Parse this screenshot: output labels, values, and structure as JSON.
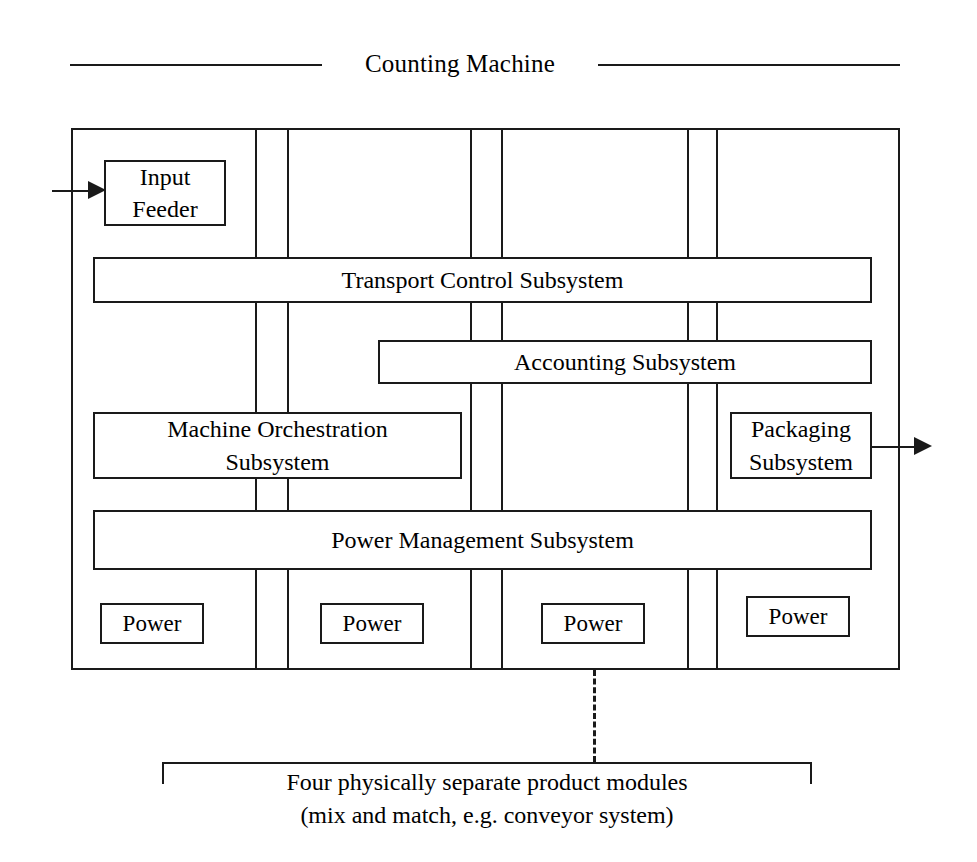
{
  "diagram": {
    "title": "Counting Machine",
    "boxes": {
      "input_feeder": "Input\nFeeder",
      "input_feeder_line1": "Input",
      "input_feeder_line2": "Feeder",
      "transport_control": "Transport Control Subsystem",
      "accounting": "Accounting Subsystem",
      "orchestration_line1": "Machine Orchestration",
      "orchestration_line2": "Subsystem",
      "packaging_line1": "Packaging",
      "packaging_line2": "Subsystem",
      "power_management": "Power Management Subsystem",
      "power_1": "Power",
      "power_2": "Power",
      "power_3": "Power",
      "power_4": "Power"
    },
    "callout": {
      "line1": "Four physically separate product modules",
      "line2": "(mix and match, e.g. conveyor system)"
    },
    "colors": {
      "stroke": "#1a1a1a",
      "background": "#ffffff"
    }
  }
}
